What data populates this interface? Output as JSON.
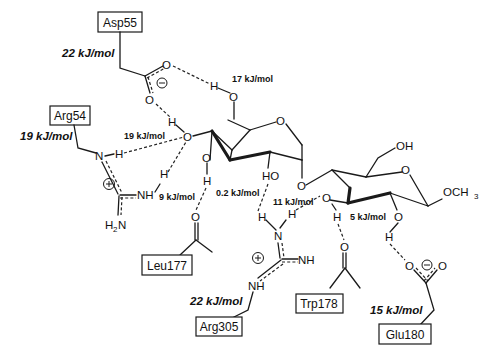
{
  "residues": {
    "asp55": "Asp55",
    "arg54": "Arg54",
    "leu177": "Leu177",
    "arg305": "Arg305",
    "trp178": "Trp178",
    "glu180": "Glu180"
  },
  "residue_energies": {
    "asp55": "22 kJ/mol",
    "arg54": "19 kJ/mol",
    "arg305": "22 kJ/mol",
    "glu180": "15 kJ/mol"
  },
  "hbond_energies": {
    "o6_asp": "17 kJ/mol",
    "o4_arg54": "19 kJ/mol",
    "o3_arg54": "9 kJ/mol",
    "o2_leu": "0.2 kJ/mol",
    "arg305": "11 kJ/mol",
    "o3b_glu": "5 kJ/mol"
  },
  "atoms": {
    "O": "O",
    "H": "H",
    "N": "N",
    "NH": "NH",
    "HO": "HO",
    "OH": "OH",
    "H2N_H": "H",
    "H2N_2": "2",
    "H2N_N": "N",
    "OCH3": "OCH",
    "OCH3_sub": "3",
    "minus": "−",
    "plus": "+"
  }
}
